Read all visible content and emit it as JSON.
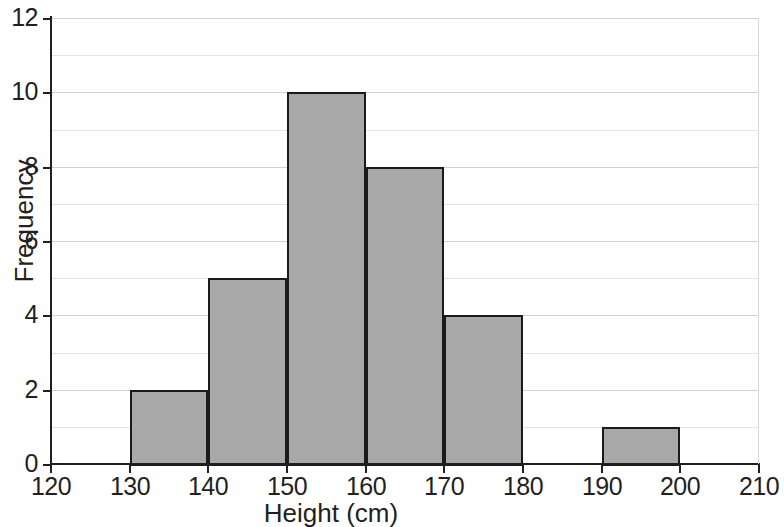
{
  "chart_data": {
    "type": "bar",
    "title": "",
    "subtitle": "",
    "xlabel": "Height (cm)",
    "ylabel": "Frequency",
    "xlim": [
      120,
      210
    ],
    "ylim": [
      0,
      12
    ],
    "xticks": [
      120,
      130,
      140,
      150,
      160,
      170,
      180,
      190,
      200,
      210
    ],
    "yticks": [
      0,
      2,
      4,
      6,
      8,
      10,
      12
    ],
    "y_minor_ticks": [
      1,
      3,
      5,
      7,
      9,
      11
    ],
    "grid": true,
    "legend": "none",
    "bin_width": 10,
    "bin_edges": [
      130,
      140,
      150,
      160,
      170,
      180,
      190,
      200
    ],
    "categories": [
      "130-140",
      "140-150",
      "150-160",
      "160-170",
      "170-180",
      "180-190",
      "190-200"
    ],
    "values": [
      2,
      5,
      10,
      8,
      4,
      0,
      1
    ],
    "bars": [
      {
        "label": "130-140",
        "x0": 130,
        "x1": 140,
        "value": 2
      },
      {
        "label": "140-150",
        "x0": 140,
        "x1": 150,
        "value": 5
      },
      {
        "label": "150-160",
        "x0": 150,
        "x1": 160,
        "value": 10
      },
      {
        "label": "160-170",
        "x0": 160,
        "x1": 170,
        "value": 8
      },
      {
        "label": "170-180",
        "x0": 170,
        "x1": 180,
        "value": 4
      },
      {
        "label": "190-200",
        "x0": 190,
        "x1": 200,
        "value": 1
      }
    ],
    "colors": {
      "bar_fill": "#a8a8a8",
      "bar_edge": "#1a1a1a",
      "axis": "#231f20",
      "grid_minor": "#e3e3e3",
      "grid_major": "#d2d2d2",
      "background": "#ffffff",
      "text": "#231f20"
    }
  }
}
